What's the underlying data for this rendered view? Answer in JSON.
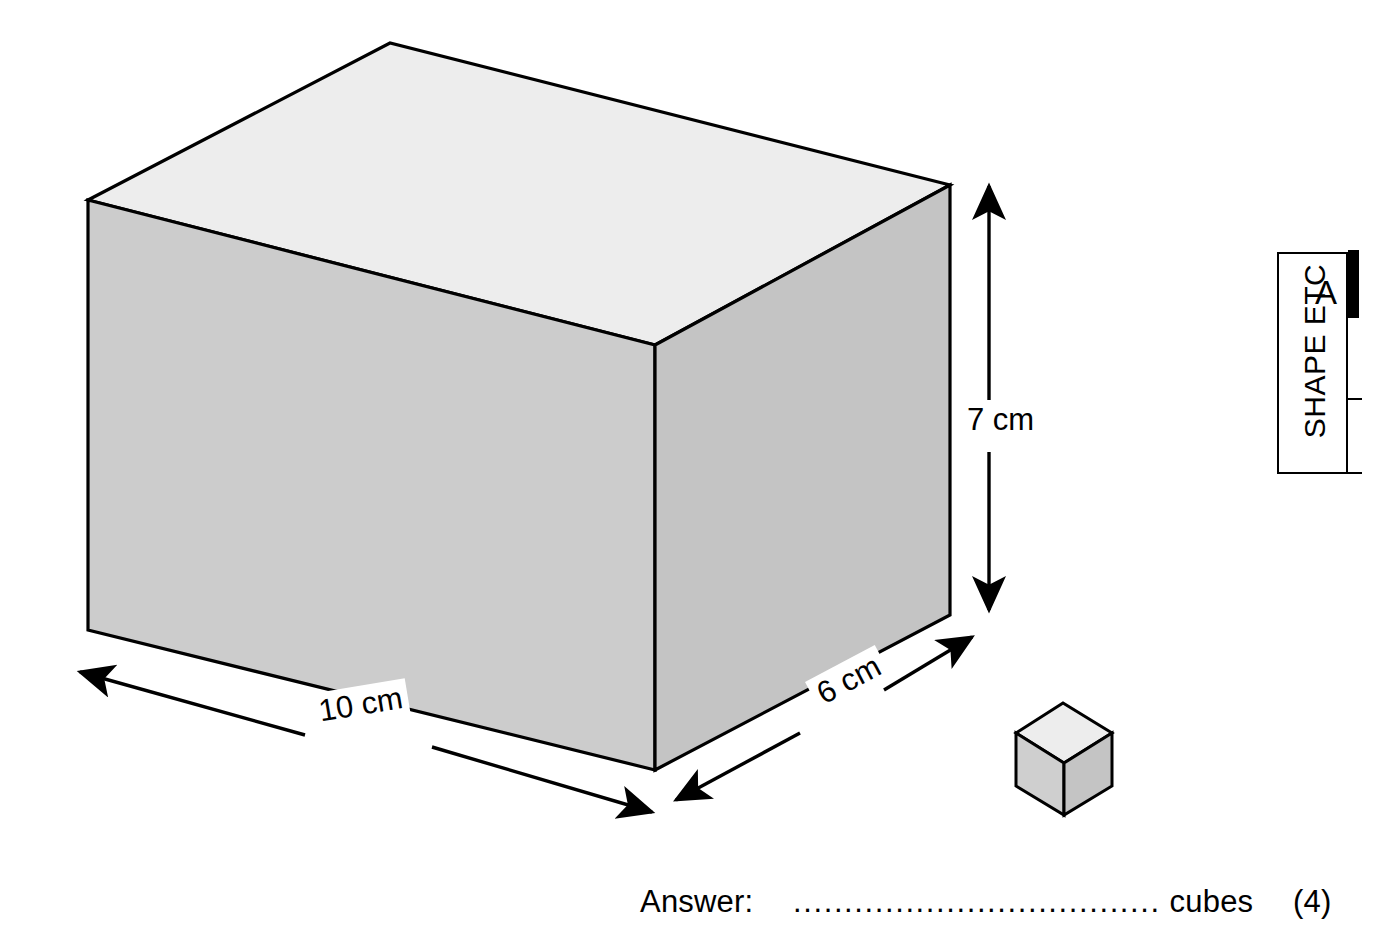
{
  "page": {
    "background_color": "#ffffff",
    "width": 1400,
    "height": 929
  },
  "figure": {
    "title_hidden": "",
    "cuboid": {
      "name": "large-cuboid",
      "top_face_color": "#ededed",
      "front_face_color": "#cccccc",
      "right_face_color": "#c4c4c4",
      "outline_color": "#000000"
    },
    "small_cube": {
      "name": "unit-cube",
      "top_face_color": "#ededed",
      "left_face_color": "#cfcfcf",
      "right_face_color": "#c4c4c4",
      "outline_color": "#000000"
    },
    "dimensions": [
      {
        "id": "width",
        "label": "10 cm",
        "value": 10,
        "unit": "cm"
      },
      {
        "id": "depth",
        "label": "6 cm",
        "value": 6,
        "unit": "cm"
      },
      {
        "id": "height",
        "label": "7 cm",
        "value": 7,
        "unit": "cm"
      }
    ]
  },
  "answer": {
    "prompt": "Answer:",
    "dots": "....................................",
    "unit": "cubes",
    "marks": "(4)"
  },
  "corner_tag": {
    "text": "SHAPE ETC",
    "letter": "A",
    "bar_color": "#000000"
  }
}
